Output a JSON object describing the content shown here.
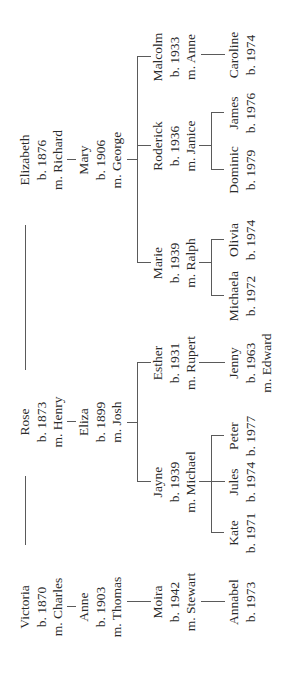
{
  "tree": {
    "generation1": [
      {
        "id": "victoria",
        "name": "Victoria",
        "born": "b. 1870",
        "spouse": "m. Charles",
        "x": 74
      },
      {
        "id": "rose",
        "name": "Rose",
        "born": "b. 1873",
        "spouse": "m. Henry",
        "x": 259
      },
      {
        "id": "elizabeth",
        "name": "Elizabeth",
        "born": "b. 1876",
        "spouse": "m. Richard",
        "x": 521
      }
    ],
    "generation2": [
      {
        "id": "anne",
        "parent": "victoria",
        "name": "Anne",
        "born": "b. 1903",
        "spouse": "m. Thomas",
        "x": 74
      },
      {
        "id": "eliza",
        "parent": "rose",
        "name": "Eliza",
        "born": "b. 1899",
        "spouse": "m. Josh",
        "x": 259
      },
      {
        "id": "mary",
        "parent": "elizabeth",
        "name": "Mary",
        "born": "b. 1906",
        "spouse": "m. George",
        "x": 521
      }
    ],
    "generation3": [
      {
        "id": "moira",
        "parent": "anne",
        "name": "Moira",
        "born": "b. 1942",
        "spouse": "m. Stewart",
        "x": 79
      },
      {
        "id": "jayne",
        "parent": "eliza",
        "name": "Jayne",
        "born": "b. 1939",
        "spouse": "m. Michael",
        "x": 199
      },
      {
        "id": "esther",
        "parent": "eliza",
        "name": "Esther",
        "born": "b. 1931",
        "spouse": "m. Rupert",
        "x": 318
      },
      {
        "id": "marie",
        "parent": "mary",
        "name": "Marie",
        "born": "b. 1939",
        "spouse": "m. Ralph",
        "x": 418
      },
      {
        "id": "roderick",
        "parent": "mary",
        "name": "Roderick",
        "born": "b. 1936",
        "spouse": "m. Janice",
        "x": 535
      },
      {
        "id": "malcolm",
        "parent": "mary",
        "name": "Malcolm",
        "born": "b. 1933",
        "spouse": "m. Anne",
        "x": 624
      }
    ],
    "generation4": [
      {
        "id": "annabel",
        "parent": "moira",
        "name": "Annabel",
        "born": "b. 1973",
        "x": 79
      },
      {
        "id": "kate",
        "parent": "jayne",
        "name": "Kate",
        "born": "b. 1971",
        "x": 148
      },
      {
        "id": "jules",
        "parent": "jayne",
        "name": "Jules",
        "born": "b. 1974",
        "x": 199
      },
      {
        "id": "peter",
        "parent": "jayne",
        "name": "Peter",
        "born": "b. 1977",
        "x": 245
      },
      {
        "id": "jenny",
        "parent": "esther",
        "name": "Jenny",
        "born": "b. 1963",
        "spouse": "m. Edward",
        "x": 318
      },
      {
        "id": "michaela",
        "parent": "marie",
        "name": "Michaela",
        "born": "b. 1972",
        "x": 385
      },
      {
        "id": "olivia",
        "parent": "marie",
        "name": "Olivia",
        "born": "b. 1974",
        "x": 441
      },
      {
        "id": "dominic",
        "parent": "roderick",
        "name": "Dominic",
        "born": "b. 1979",
        "x": 511
      },
      {
        "id": "james",
        "parent": "roderick",
        "name": "James",
        "born": "b. 1976",
        "x": 568
      },
      {
        "id": "caroline",
        "parent": "malcolm",
        "name": "Caroline",
        "born": "b. 1974",
        "x": 626
      }
    ]
  },
  "colors": {
    "text": "#2a2a2a",
    "lines": "#5a5a5a",
    "background": "#ffffff"
  }
}
